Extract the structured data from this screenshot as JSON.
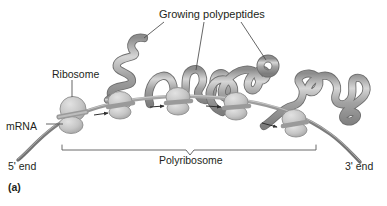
{
  "figure": {
    "panel_label": "(a)",
    "title_label": "Growing polypeptides",
    "labels": {
      "ribosome": "Ribosome",
      "mrna": "mRNA",
      "polyribosome": "Polyribosome",
      "five_prime": "5' end",
      "three_prime": "3' end"
    },
    "colors": {
      "background": "#ffffff",
      "text": "#231f20",
      "polypeptide_tube": "#9b9b9b",
      "polypeptide_highlight": "#cfcfcf",
      "polypeptide_outline": "#6f6f6f",
      "ribosome_body": "#c9c9c9",
      "ribosome_band": "#a0a0a0",
      "mrna_strand": "#8c8c8c",
      "leader_line": "#4a4a4a",
      "bracket": "#5a5a5a"
    },
    "ribosome_count": 5,
    "direction_arrows": 4,
    "leader_lines_from_title": 3
  }
}
